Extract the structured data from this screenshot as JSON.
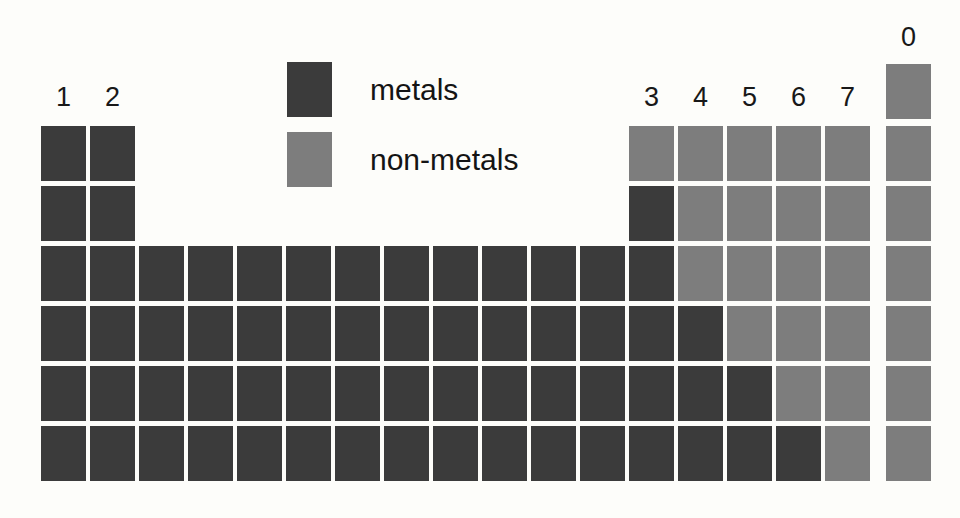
{
  "diagram": {
    "background_color": "#fdfdfa"
  },
  "legend": {
    "items": [
      {
        "key": "metals",
        "label": "metals",
        "color": "#3b3b3b"
      },
      {
        "key": "nonmetals",
        "label": "non-metals",
        "color": "#7d7d7d"
      }
    ]
  },
  "group_labels": [
    {
      "text": "1",
      "column": 1,
      "x": 41,
      "y": 82
    },
    {
      "text": "2",
      "column": 2,
      "x": 90,
      "y": 82
    },
    {
      "text": "3",
      "column": 13,
      "x": 629,
      "y": 82
    },
    {
      "text": "4",
      "column": 14,
      "x": 678,
      "y": 82
    },
    {
      "text": "5",
      "column": 15,
      "x": 727,
      "y": 82
    },
    {
      "text": "6",
      "column": 16,
      "x": 776,
      "y": 82
    },
    {
      "text": "7",
      "column": 17,
      "x": 825,
      "y": 82
    },
    {
      "text": "0",
      "column": 18,
      "x": 886,
      "y": 22
    }
  ],
  "grid": {
    "columns": 18,
    "rows": 6,
    "cell_width": 45,
    "cell_height": 55,
    "column_pitch": 49,
    "row_pitch": 60,
    "origin_x": 41,
    "origin_y": 126,
    "helium_cell": {
      "column": 18,
      "x": 886,
      "y": 64,
      "type": "nonmetal"
    },
    "periods": [
      {
        "period": 2,
        "y": 126,
        "cells": [
          {
            "column": 1,
            "x": 41,
            "type": "metal"
          },
          {
            "column": 2,
            "x": 90,
            "type": "metal"
          },
          {
            "column": 13,
            "x": 629,
            "type": "nonmetal"
          },
          {
            "column": 14,
            "x": 678,
            "type": "nonmetal"
          },
          {
            "column": 15,
            "x": 727,
            "type": "nonmetal"
          },
          {
            "column": 16,
            "x": 776,
            "type": "nonmetal"
          },
          {
            "column": 17,
            "x": 825,
            "type": "nonmetal"
          },
          {
            "column": 18,
            "x": 886,
            "type": "nonmetal"
          }
        ]
      },
      {
        "period": 3,
        "y": 186,
        "cells": [
          {
            "column": 1,
            "x": 41,
            "type": "metal"
          },
          {
            "column": 2,
            "x": 90,
            "type": "metal"
          },
          {
            "column": 13,
            "x": 629,
            "type": "metal"
          },
          {
            "column": 14,
            "x": 678,
            "type": "nonmetal"
          },
          {
            "column": 15,
            "x": 727,
            "type": "nonmetal"
          },
          {
            "column": 16,
            "x": 776,
            "type": "nonmetal"
          },
          {
            "column": 17,
            "x": 825,
            "type": "nonmetal"
          },
          {
            "column": 18,
            "x": 886,
            "type": "nonmetal"
          }
        ]
      },
      {
        "period": 4,
        "y": 246,
        "cells": [
          {
            "column": 1,
            "x": 41,
            "type": "metal"
          },
          {
            "column": 2,
            "x": 90,
            "type": "metal"
          },
          {
            "column": 3,
            "x": 139,
            "type": "metal"
          },
          {
            "column": 4,
            "x": 188,
            "type": "metal"
          },
          {
            "column": 5,
            "x": 237,
            "type": "metal"
          },
          {
            "column": 6,
            "x": 286,
            "type": "metal"
          },
          {
            "column": 7,
            "x": 335,
            "type": "metal"
          },
          {
            "column": 8,
            "x": 384,
            "type": "metal"
          },
          {
            "column": 9,
            "x": 433,
            "type": "metal"
          },
          {
            "column": 10,
            "x": 482,
            "type": "metal"
          },
          {
            "column": 11,
            "x": 531,
            "type": "metal"
          },
          {
            "column": 12,
            "x": 580,
            "type": "metal"
          },
          {
            "column": 13,
            "x": 629,
            "type": "metal"
          },
          {
            "column": 14,
            "x": 678,
            "type": "nonmetal"
          },
          {
            "column": 15,
            "x": 727,
            "type": "nonmetal"
          },
          {
            "column": 16,
            "x": 776,
            "type": "nonmetal"
          },
          {
            "column": 17,
            "x": 825,
            "type": "nonmetal"
          },
          {
            "column": 18,
            "x": 886,
            "type": "nonmetal"
          }
        ]
      },
      {
        "period": 5,
        "y": 306,
        "cells": [
          {
            "column": 1,
            "x": 41,
            "type": "metal"
          },
          {
            "column": 2,
            "x": 90,
            "type": "metal"
          },
          {
            "column": 3,
            "x": 139,
            "type": "metal"
          },
          {
            "column": 4,
            "x": 188,
            "type": "metal"
          },
          {
            "column": 5,
            "x": 237,
            "type": "metal"
          },
          {
            "column": 6,
            "x": 286,
            "type": "metal"
          },
          {
            "column": 7,
            "x": 335,
            "type": "metal"
          },
          {
            "column": 8,
            "x": 384,
            "type": "metal"
          },
          {
            "column": 9,
            "x": 433,
            "type": "metal"
          },
          {
            "column": 10,
            "x": 482,
            "type": "metal"
          },
          {
            "column": 11,
            "x": 531,
            "type": "metal"
          },
          {
            "column": 12,
            "x": 580,
            "type": "metal"
          },
          {
            "column": 13,
            "x": 629,
            "type": "metal"
          },
          {
            "column": 14,
            "x": 678,
            "type": "metal"
          },
          {
            "column": 15,
            "x": 727,
            "type": "nonmetal"
          },
          {
            "column": 16,
            "x": 776,
            "type": "nonmetal"
          },
          {
            "column": 17,
            "x": 825,
            "type": "nonmetal"
          },
          {
            "column": 18,
            "x": 886,
            "type": "nonmetal"
          }
        ]
      },
      {
        "period": 6,
        "y": 366,
        "cells": [
          {
            "column": 1,
            "x": 41,
            "type": "metal"
          },
          {
            "column": 2,
            "x": 90,
            "type": "metal"
          },
          {
            "column": 3,
            "x": 139,
            "type": "metal"
          },
          {
            "column": 4,
            "x": 188,
            "type": "metal"
          },
          {
            "column": 5,
            "x": 237,
            "type": "metal"
          },
          {
            "column": 6,
            "x": 286,
            "type": "metal"
          },
          {
            "column": 7,
            "x": 335,
            "type": "metal"
          },
          {
            "column": 8,
            "x": 384,
            "type": "metal"
          },
          {
            "column": 9,
            "x": 433,
            "type": "metal"
          },
          {
            "column": 10,
            "x": 482,
            "type": "metal"
          },
          {
            "column": 11,
            "x": 531,
            "type": "metal"
          },
          {
            "column": 12,
            "x": 580,
            "type": "metal"
          },
          {
            "column": 13,
            "x": 629,
            "type": "metal"
          },
          {
            "column": 14,
            "x": 678,
            "type": "metal"
          },
          {
            "column": 15,
            "x": 727,
            "type": "metal"
          },
          {
            "column": 16,
            "x": 776,
            "type": "nonmetal"
          },
          {
            "column": 17,
            "x": 825,
            "type": "nonmetal"
          },
          {
            "column": 18,
            "x": 886,
            "type": "nonmetal"
          }
        ]
      },
      {
        "period": 7,
        "y": 426,
        "cells": [
          {
            "column": 1,
            "x": 41,
            "type": "metal"
          },
          {
            "column": 2,
            "x": 90,
            "type": "metal"
          },
          {
            "column": 3,
            "x": 139,
            "type": "metal"
          },
          {
            "column": 4,
            "x": 188,
            "type": "metal"
          },
          {
            "column": 5,
            "x": 237,
            "type": "metal"
          },
          {
            "column": 6,
            "x": 286,
            "type": "metal"
          },
          {
            "column": 7,
            "x": 335,
            "type": "metal"
          },
          {
            "column": 8,
            "x": 384,
            "type": "metal"
          },
          {
            "column": 9,
            "x": 433,
            "type": "metal"
          },
          {
            "column": 10,
            "x": 482,
            "type": "metal"
          },
          {
            "column": 11,
            "x": 531,
            "type": "metal"
          },
          {
            "column": 12,
            "x": 580,
            "type": "metal"
          },
          {
            "column": 13,
            "x": 629,
            "type": "metal"
          },
          {
            "column": 14,
            "x": 678,
            "type": "metal"
          },
          {
            "column": 15,
            "x": 727,
            "type": "metal"
          },
          {
            "column": 16,
            "x": 776,
            "type": "metal"
          },
          {
            "column": 17,
            "x": 825,
            "type": "nonmetal"
          },
          {
            "column": 18,
            "x": 886,
            "type": "nonmetal"
          }
        ]
      }
    ]
  },
  "legend_layout": {
    "metals_row": {
      "x": 287,
      "y": 62
    },
    "nonmetals_row": {
      "x": 287,
      "y": 132
    }
  }
}
